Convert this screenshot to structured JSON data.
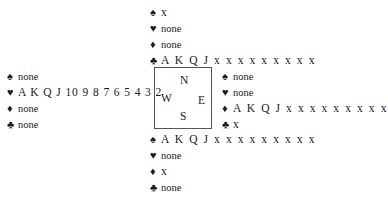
{
  "suits": {
    "spades": "♠",
    "hearts": "♥",
    "diamonds": "♦",
    "clubs": "♣"
  },
  "hands": {
    "north": {
      "spades": "x",
      "hearts": "none",
      "diamonds": "none",
      "clubs": "A K Q J x x x x x x x x x"
    },
    "west": {
      "spades": "none",
      "hearts": "A K Q J 10 9 8 7 6 5 4 3 2",
      "diamonds": "none",
      "clubs": "none"
    },
    "east": {
      "spades": "none",
      "hearts": "none",
      "diamonds": "A K Q J x x x x x x x x x",
      "clubs": "x"
    },
    "south": {
      "spades": "A K Q J x x x x x x x x x",
      "hearts": "none",
      "diamonds": "x",
      "clubs": "none"
    }
  },
  "compass": {
    "north": "N",
    "west": "W",
    "east": "E",
    "south": "S"
  }
}
